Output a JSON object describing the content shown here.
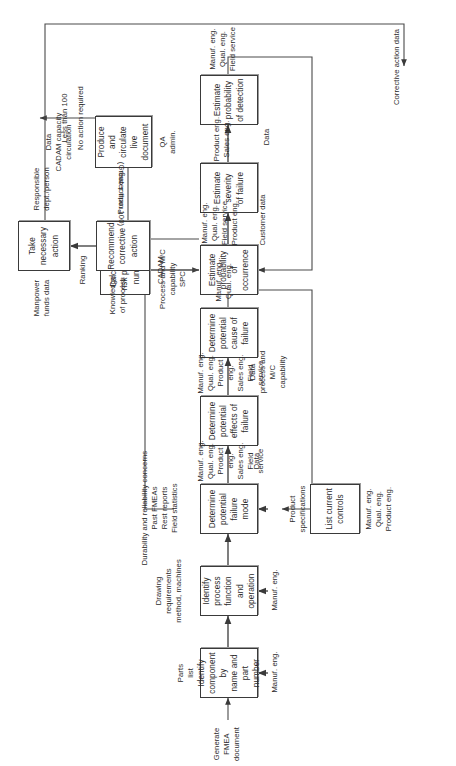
{
  "diagram": {
    "orientation": "rotated-90-ccw",
    "nodes": [
      {
        "id": "n1",
        "label": "Identify\ncomponent by\nname and part\nnumber"
      },
      {
        "id": "n2",
        "label": "Identify\nprocess\nfunction and\noperation"
      },
      {
        "id": "n3",
        "label": "Determine\npotential\nfailure mode"
      },
      {
        "id": "n4",
        "label": "Determine\npotential\neffects of\nfailure"
      },
      {
        "id": "n5",
        "label": "Determine\npotential\ncause of\nfailure"
      },
      {
        "id": "n6",
        "label": "List current\ncontrols"
      },
      {
        "id": "n7",
        "label": "Estimate\nprobability of\noccurrence"
      },
      {
        "id": "n8",
        "label": "Estimate\nseverity\nof failure"
      },
      {
        "id": "n9",
        "label": "Estimate\nprobability\nof detection"
      },
      {
        "id": "n10",
        "label": "Calculate\nrisk priority\nnumber"
      },
      {
        "id": "n11",
        "label": "Produce and\ncirculate\nlive document"
      },
      {
        "id": "n12",
        "label": "Recommend\ncorrective\naction"
      },
      {
        "id": "n13",
        "label": "Take\nnecessary\naction"
      }
    ],
    "labels": {
      "start": "Generate\nFMEA\ndocument",
      "parts_list": "Parts\nlist",
      "n1_resource": "Manuf. eng.",
      "drawing": "Drawing\nrequirements\nmethod, machines",
      "n2_resource": "Manuf. eng.",
      "durability": "Durability and reliability concerns\nPast FMEAs\nRest reports\nField statistics",
      "n3_resource": "Manuf. eng.\nQual. eng.\nProduct eng.\nSales eng.\nField service",
      "data_1": "Data",
      "n4_resource": "Manuf. eng.\nQual. eng.\nProduct eng.\nSales eng.\nField service",
      "data_process_cap": "Data\nprocess and M/C\ncapability",
      "n5_resource": "Manuf. eng.\nQual. eng.",
      "product_specs": "Product\nspecifications",
      "n6_resource": "Manuf. eng.\nQual. eng.\nProduct eng.",
      "process_mc_spc": "Process and M/C\ncapability\nSPC",
      "n7_resource": "Manuf. eng.\nQual. eng.\nField service\nProduct eng.",
      "customer_data": "Customer data",
      "n8_resource": "Product eng.\nSales eng.",
      "data_2": "Data",
      "n9_resource": "Manuf. eng.\nQual. eng.\nField service",
      "ranking": "Ranking",
      "n10_resource": "CADAM",
      "cadam_capacity": "Data\nCADAM capacity\ncirculation",
      "n11_resource": "QA\nadmin.",
      "less_than_100": "Less than 100",
      "no_action": "No action required",
      "greater_than_100": "(Greater than 100)",
      "knowledge": "Knowledge\nof process",
      "n12_resource": "Product eng.",
      "manpower": "Manpower\nfunds data",
      "n13_resource": "Responsible\ndept./person",
      "corrective_action_data": "Corrective action data"
    }
  }
}
